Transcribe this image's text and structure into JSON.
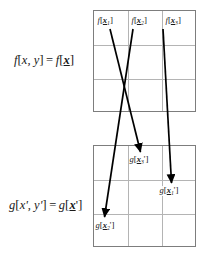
{
  "figure": {
    "type": "coordinate-remapping-diagram"
  },
  "equations": {
    "source": {
      "fn": "f",
      "open": "[",
      "args": "x, y",
      "close": "]",
      "equals": "=",
      "fn2": "f",
      "vector": "x",
      "full_text": "f[x, y] = f[x]"
    },
    "destination": {
      "fn": "g",
      "open": "[",
      "args": "x', y'",
      "close": "]",
      "equals": "=",
      "fn2": "g",
      "vector": "x",
      "prime": "'",
      "full_text": "g[x', y'] = g[x']"
    }
  },
  "grids": {
    "top": {
      "name": "source-grid",
      "rows": 3,
      "cols": 3,
      "border_color": "#7d7d7d",
      "gridline_color": "#b4b4b4"
    },
    "bottom": {
      "name": "destination-grid",
      "rows": 3,
      "cols": 3,
      "border_color": "#7d7d7d",
      "gridline_color": "#b4b4b4"
    }
  },
  "source_labels": [
    {
      "fn": "f",
      "vector": "x",
      "subscript": "1",
      "prime": "",
      "row": 0,
      "col": 0
    },
    {
      "fn": "f",
      "vector": "x",
      "subscript": "2",
      "prime": "",
      "row": 0,
      "col": 1
    },
    {
      "fn": "f",
      "vector": "x",
      "subscript": "3",
      "prime": "",
      "row": 0,
      "col": 2
    }
  ],
  "destination_labels": [
    {
      "fn": "g",
      "vector": "x",
      "subscript": "3",
      "prime": "'",
      "row": 0,
      "col": 1
    },
    {
      "fn": "g",
      "vector": "x",
      "subscript": "1",
      "prime": "'",
      "row": 1,
      "col": 2
    },
    {
      "fn": "g",
      "vector": "x",
      "subscript": "2",
      "prime": "'",
      "row": 2,
      "col": 0
    }
  ],
  "arrows": [
    {
      "from": "f[x1]",
      "to": "g[x3']",
      "color": "#000000"
    },
    {
      "from": "f[x2]",
      "to": "g[x2']",
      "color": "#000000"
    },
    {
      "from": "f[x3]",
      "to": "g[x1']",
      "color": "#000000"
    }
  ],
  "colors": {
    "ink": "#1a1a1a",
    "arrow": "#000000",
    "grid_border": "#7d7d7d",
    "gridline": "#b4b4b4",
    "background": "#ffffff"
  }
}
